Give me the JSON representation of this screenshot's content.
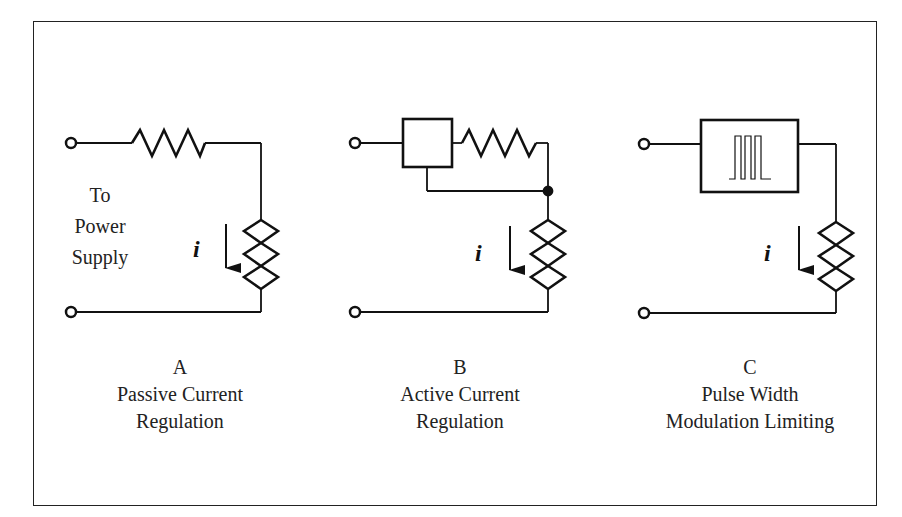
{
  "figure": {
    "circuits": [
      {
        "id": "A",
        "letter": "A",
        "title_line1": "Passive Current",
        "title_line2": "Regulation",
        "elements": [
          "input-terminal-top",
          "resistor",
          "heater-coil",
          "input-terminal-bottom"
        ],
        "current_symbol": "i"
      },
      {
        "id": "B",
        "letter": "B",
        "title_line1": "Active Current",
        "title_line2": "Regulation",
        "elements": [
          "input-terminal-top",
          "regulator-box",
          "resistor",
          "junction-dot",
          "heater-coil",
          "input-terminal-bottom"
        ],
        "current_symbol": "i"
      },
      {
        "id": "C",
        "letter": "C",
        "title_line1": "Pulse Width",
        "title_line2": "Modulation Limiting",
        "elements": [
          "input-terminal-top",
          "pwm-box",
          "heater-coil",
          "input-terminal-bottom"
        ],
        "current_symbol": "i"
      }
    ],
    "power_supply_label": {
      "line1": "To",
      "line2": "Power",
      "line3": "Supply"
    }
  }
}
